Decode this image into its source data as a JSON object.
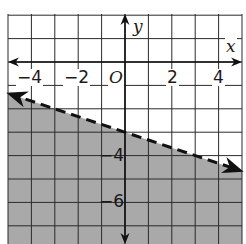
{
  "chart_data": {
    "type": "inequality-graph",
    "title": "",
    "xlabel": "x",
    "ylabel": "y",
    "xlim": [
      -5,
      5
    ],
    "ylim": [
      -7.8,
      2
    ],
    "grid": true,
    "x_ticks": [
      {
        "value": -4,
        "label": "−4"
      },
      {
        "value": -2,
        "label": "−2"
      },
      {
        "value": 2,
        "label": "2"
      },
      {
        "value": 4,
        "label": "4"
      }
    ],
    "y_ticks": [
      {
        "value": -4,
        "label": "−4"
      },
      {
        "value": -6,
        "label": "−6"
      }
    ],
    "origin_label": "O",
    "boundary_line": {
      "equation": "y = -1/3 x - 3",
      "slope": -0.3333,
      "intercept": -3,
      "style": "dashed",
      "arrows": "both",
      "points": [
        [
          -4.9,
          -1.37
        ],
        [
          4.9,
          -4.63
        ]
      ]
    },
    "inequality": "y < -1/3 x - 3",
    "shaded_region": "below",
    "colors": {
      "shade": "#a9a9a9",
      "grid": "#2a2a2a",
      "line": "#111111",
      "background": "#ffffff"
    }
  }
}
